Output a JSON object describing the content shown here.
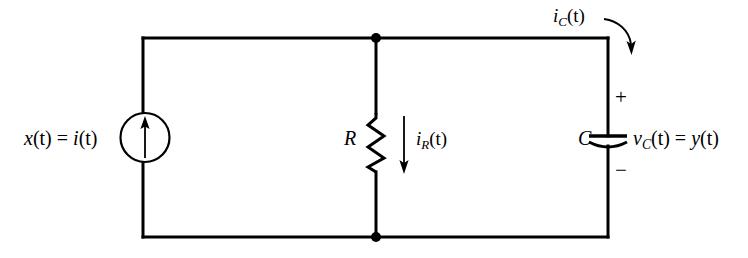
{
  "diagram": {
    "background_color": "#ffffff",
    "line_color": "#000000",
    "line_width": 3
  },
  "labels": {
    "source": {
      "text": "x(t) = i(t)",
      "parts": {
        "x": "x",
        "t1": "(t)",
        "eq": " = ",
        "i": "i",
        "t2": "(t)"
      }
    },
    "resistor": {
      "text": "R"
    },
    "resistor_current": {
      "text": "iR(t)",
      "parts": {
        "i": "i",
        "sub": "R",
        "t": "(t)"
      }
    },
    "capacitor": {
      "text": "C"
    },
    "capacitor_current": {
      "text": "iC(t)",
      "parts": {
        "i": "i",
        "sub": "C",
        "t": "(t)"
      }
    },
    "capacitor_voltage": {
      "text": "vC(t) = y(t)",
      "parts": {
        "v": "v",
        "sub": "C",
        "t1": "(t)",
        "eq": " = ",
        "y": "y",
        "t2": "(t)"
      }
    },
    "polarity_plus": {
      "text": "+"
    },
    "polarity_minus": {
      "text": "−"
    }
  },
  "components": {
    "current_source": {
      "name": "current source",
      "symbol": "circle-with-up-arrow",
      "cx": 145,
      "cy": 137,
      "r": 24
    },
    "resistor": {
      "name": "resistor",
      "symbol": "zigzag",
      "x": 376,
      "y_top": 113,
      "y_bottom": 172
    },
    "capacitor": {
      "name": "capacitor",
      "symbol": "curved-plate",
      "x": 608,
      "y_plate_top": 136,
      "y_plate_bottom": 146
    },
    "node_top": {
      "x": 376,
      "y": 38
    },
    "node_bottom": {
      "x": 376,
      "y": 237
    }
  },
  "wires": {
    "left_x": 143,
    "right_x": 608,
    "top_y": 38,
    "bottom_y": 237
  }
}
